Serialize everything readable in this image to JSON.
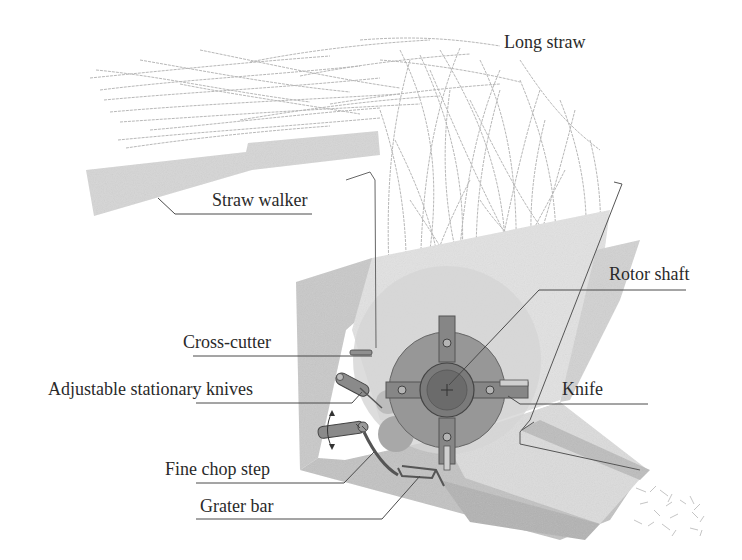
{
  "figure": {
    "labels": {
      "long_straw": "Long straw",
      "straw_walker": "Straw walker",
      "rotor_shaft": "Rotor shaft",
      "cross_cutter": "Cross-cutter",
      "adjustable_stationary_knives": "Adjustable stationary knives",
      "knife": "Knife",
      "fine_chop_step": "Fine chop step",
      "grater_bar": "Grater bar"
    },
    "colors": {
      "housing_light": "#d9d9d9",
      "housing_mid": "#c4c4c4",
      "housing_dark": "#a9a9a9",
      "rotor_disc": "#8f8f8f",
      "rotor_hub": "#6e6e6e",
      "straw": "#b5b5b5",
      "leader_line": "#4a4a4a",
      "text": "#2a2a2a"
    }
  }
}
